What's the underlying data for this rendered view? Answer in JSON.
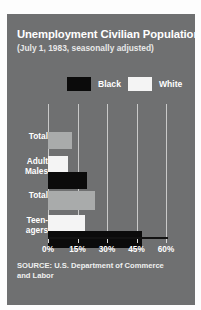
{
  "chart_data": {
    "type": "bar",
    "orientation": "horizontal",
    "title": "Unemployment Civilian Population",
    "subtitle": "(July 1, 1983, seasonally adjusted)",
    "xlabel": "",
    "ylabel": "",
    "xlim": [
      0,
      60
    ],
    "xticks": [
      0,
      15,
      30,
      45,
      60
    ],
    "xticklabels": [
      "0%",
      "15%",
      "30%",
      "45%",
      "60%"
    ],
    "grid": true,
    "legend_position": "top",
    "legend": [
      {
        "name": "Black",
        "color": "#0b0b0b"
      },
      {
        "name": "White",
        "color": "#f4f4f4"
      }
    ],
    "categories": [
      "Total",
      "Adult Males",
      "Total",
      "Teen-agers"
    ],
    "bars": [
      {
        "category": "Total",
        "group": "white-total",
        "series": "White",
        "value": 12,
        "color": "#a9abab"
      },
      {
        "category": "Adult Males",
        "group": "white-adult",
        "series": "White",
        "value": 10,
        "color": "#f4f4f4"
      },
      {
        "category": "Adult Males",
        "group": "black-adult",
        "series": "Black",
        "value": 20,
        "color": "#0b0b0b"
      },
      {
        "category": "Total",
        "group": "black-total",
        "series": "Black",
        "value": 24,
        "color": "#a9abab"
      },
      {
        "category": "Teen-agers",
        "group": "white-teen",
        "series": "White",
        "value": 19,
        "color": "#f4f4f4"
      },
      {
        "category": "Teen-agers",
        "group": "black-teen",
        "series": "Black",
        "value": 48,
        "color": "#0b0b0b"
      }
    ],
    "source": "SOURCE: U.S. Department of Commerce and Labor",
    "colors": {
      "panel_background": "#6f7071",
      "page_background": "#fdfdfd",
      "gridline": "#c9c9c9",
      "axis": "#121212",
      "text": "#ffffff"
    }
  },
  "labels": {
    "row_0": "Total",
    "row_1": "Adult\nMales",
    "row_1_line_a": "Adult",
    "row_1_line_b": "Males",
    "row_2": "Total",
    "row_3_line_a": "Teen-",
    "row_3_line_b": "agers"
  },
  "source_note": {
    "line_a": "SOURCE: U.S. Department of Commerce",
    "line_b": "and Labor"
  }
}
